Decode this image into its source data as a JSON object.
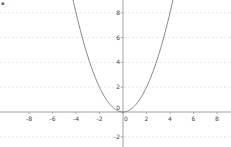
{
  "chart_data": {
    "type": "line",
    "title": "",
    "xlabel": "",
    "ylabel": "",
    "function": "y = x^2 / 2",
    "xlim": [
      -10.5,
      9.3
    ],
    "ylim": [
      -2.8,
      9.0
    ],
    "x_ticks": [
      -8,
      -6,
      -4,
      -2,
      0,
      2,
      4,
      6,
      8
    ],
    "x_tick_labels": [
      "-8",
      "-6",
      "-4",
      "-2",
      "0",
      "2",
      "4",
      "6",
      "8"
    ],
    "y_ticks": [
      -2,
      2,
      4,
      6,
      8
    ],
    "y_tick_labels": [
      "-2",
      "2",
      "4",
      "6",
      "8"
    ],
    "origin_label": "0",
    "grid": true,
    "grid_style": "horizontal dashed at y = -2, 2, 4, 6, 8",
    "series": [
      {
        "name": "parabola",
        "x": [
          -4.24,
          -4,
          -3,
          -2,
          -1,
          0,
          1,
          2,
          3,
          4,
          4.24
        ],
        "y": [
          9.0,
          8.0,
          4.5,
          2.0,
          0.5,
          0,
          0.5,
          2.0,
          4.5,
          8.0,
          9.0
        ],
        "color": "#777777"
      }
    ],
    "legend": null
  },
  "colors": {
    "background": "#ffffff",
    "axis": "#888888",
    "grid": "#d8d8d8",
    "curve": "#777777",
    "labels": "#444444"
  },
  "corner_mark": "▪"
}
